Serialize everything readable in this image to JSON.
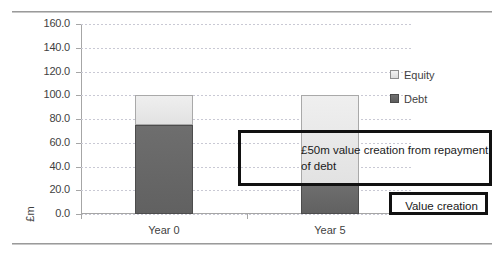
{
  "chart_data": {
    "type": "bar",
    "stacked": true,
    "title": "",
    "xlabel": "",
    "ylabel": "£m",
    "categories": [
      "Year 0",
      "Year 5"
    ],
    "series": [
      {
        "name": "Debt",
        "values": [
          75,
          25
        ]
      },
      {
        "name": "Equity",
        "values": [
          25,
          75
        ]
      }
    ],
    "ylim": [
      0,
      160
    ],
    "ytick_step": 20,
    "yticks": [
      "0.0",
      "20.0",
      "40.0",
      "60.0",
      "80.0",
      "100.0",
      "120.0",
      "140.0",
      "160.0"
    ],
    "grid": true,
    "legend_position": "right",
    "legend": [
      "Equity",
      "Debt"
    ],
    "colors": {
      "equity": "#e8e8e8",
      "debt": "#666666",
      "callout_border": "#111111",
      "gridline": "#c9c9d4",
      "axis": "#a6a6a6",
      "text": "#3f3f3f"
    },
    "annotations": [
      {
        "name": "value-creation-callout",
        "text": "£50m value creation from repayment of debt"
      },
      {
        "name": "value-creation-key",
        "text": "Value creation"
      }
    ]
  }
}
